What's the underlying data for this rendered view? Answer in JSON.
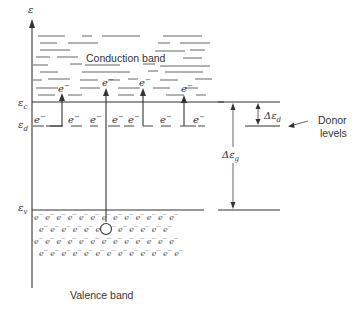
{
  "diagram": {
    "axis": {
      "label": "ε"
    },
    "levels": {
      "conduction_edge": {
        "symbol": "ε",
        "subscript": "c"
      },
      "donor": {
        "symbol": "ε",
        "subscript": "d"
      },
      "valence_edge": {
        "symbol": "ε",
        "subscript": "v"
      }
    },
    "bands": {
      "conduction": "Conduction band",
      "valence": "Valence band"
    },
    "gaps": {
      "donor_gap": {
        "symbol": "Δε",
        "subscript": "d"
      },
      "band_gap": {
        "symbol": "Δε",
        "subscript": "g"
      }
    },
    "annotations": {
      "donor_levels_line1": "Donor",
      "donor_levels_line2": "levels"
    },
    "electron_symbol": "e",
    "electron_superscript": "−",
    "colors": {
      "ink": "#333333",
      "background": "#ffffff"
    }
  }
}
